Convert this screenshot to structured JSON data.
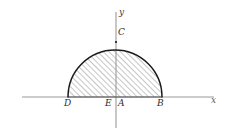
{
  "figure": {
    "type": "geometry-diagram",
    "axes": {
      "x_label": "x",
      "y_label": "y",
      "x_axis": {
        "x_start": 22,
        "x_end": 214,
        "y": 97
      },
      "y_axis": {
        "x": 116,
        "y_start": 12,
        "y_end": 128
      }
    },
    "semicircle": {
      "center_x": 115,
      "center_y": 97,
      "radius": 47,
      "start_x": 68,
      "end_x": 162,
      "apex_y": 42,
      "stroke_color": "#1a1a1a",
      "hatch_color": "#8a8a8a",
      "hatch_angle_deg": 45,
      "hatch_spacing_px": 4
    },
    "points": [
      {
        "id": "C",
        "label": "C",
        "x": 116,
        "y": 42,
        "position": "apex-top"
      },
      {
        "id": "D",
        "label": "D",
        "x": 68,
        "y": 97,
        "position": "axis-left-end"
      },
      {
        "id": "E",
        "label": "E",
        "x": 110,
        "y": 97,
        "position": "axis-center"
      },
      {
        "id": "A",
        "label": "A",
        "x": 121,
        "y": 97,
        "position": "axis-origin"
      },
      {
        "id": "B",
        "label": "B",
        "x": 161,
        "y": 97,
        "position": "axis-right-end"
      }
    ],
    "colors": {
      "background": "#ffffff",
      "axis": "#9a9a9a",
      "curve": "#1a1a1a",
      "hatch": "#8d8d8d",
      "label": "#2e2e2e"
    }
  }
}
